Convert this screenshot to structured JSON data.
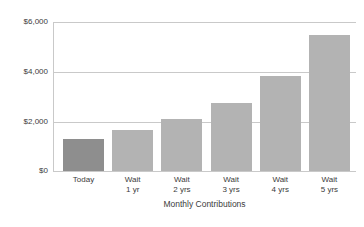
{
  "chart_data": {
    "type": "bar",
    "title": "",
    "xlabel": "Monthly Contributions",
    "ylabel": "",
    "categories": [
      "Today",
      "Wait\n1 yr",
      "Wait\n2 yrs",
      "Wait\n3 yrs",
      "Wait\n4 yrs",
      "Wait\n5 yrs"
    ],
    "category_lines": [
      [
        "Today",
        ""
      ],
      [
        "Wait",
        "1 yr"
      ],
      [
        "Wait",
        "2 yrs"
      ],
      [
        "Wait",
        "3 yrs"
      ],
      [
        "Wait",
        "4 yrs"
      ],
      [
        "Wait",
        "5 yrs"
      ]
    ],
    "values": [
      1300,
      1640,
      2100,
      2760,
      3840,
      5480
    ],
    "ylim": [
      0,
      6000
    ],
    "ytick_values": [
      0,
      2000,
      4000,
      6000
    ],
    "ytick_labels": [
      "$0",
      "$2,000",
      "$4,000",
      "$6,000"
    ],
    "grid": true,
    "legend": "none",
    "highlight_index": 0,
    "colors": {
      "bar": "#b3b3b3",
      "bar_highlight": "#8e8e8e",
      "gridline": "#c9c9c9",
      "text": "#3b3b3b",
      "background": "#ffffff"
    }
  }
}
